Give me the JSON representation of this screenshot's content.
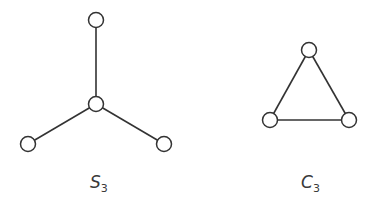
{
  "graphs": [
    {
      "name": "S",
      "subscript": "3",
      "nodes": [
        {
          "id": "top",
          "x": 96,
          "y": 20
        },
        {
          "id": "center",
          "x": 96,
          "y": 104
        },
        {
          "id": "left",
          "x": 28,
          "y": 144
        },
        {
          "id": "right",
          "x": 164,
          "y": 144
        }
      ],
      "edges": [
        [
          "center",
          "top"
        ],
        [
          "center",
          "left"
        ],
        [
          "center",
          "right"
        ]
      ]
    },
    {
      "name": "C",
      "subscript": "3",
      "nodes": [
        {
          "id": "top",
          "x": 309,
          "y": 50
        },
        {
          "id": "left",
          "x": 270,
          "y": 120
        },
        {
          "id": "right",
          "x": 349,
          "y": 120
        }
      ],
      "edges": [
        [
          "top",
          "left"
        ],
        [
          "top",
          "right"
        ],
        [
          "left",
          "right"
        ]
      ]
    }
  ],
  "colors": {
    "stroke": "#333333",
    "background": "#ffffff"
  }
}
